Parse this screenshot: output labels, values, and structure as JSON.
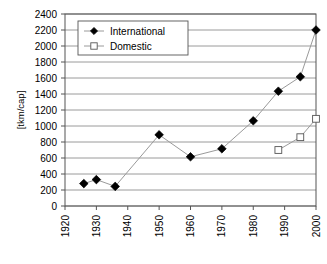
{
  "chart_data": {
    "type": "line",
    "title": "",
    "xlabel": "",
    "ylabel": "[tkm/cap]",
    "xlim": [
      1920,
      2000
    ],
    "ylim": [
      0,
      2400
    ],
    "grid": true,
    "legend_position": "top-left",
    "xticks": [
      "1920",
      "1930",
      "1940",
      "1950",
      "1960",
      "1970",
      "1980",
      "1990",
      "2000"
    ],
    "xtick_values": [
      1920,
      1930,
      1940,
      1950,
      1960,
      1970,
      1980,
      1990,
      2000
    ],
    "yticks": [
      "0",
      "200",
      "400",
      "600",
      "800",
      "1000",
      "1200",
      "1400",
      "1600",
      "1800",
      "2000",
      "2200",
      "2400"
    ],
    "ytick_values": [
      0,
      200,
      400,
      600,
      800,
      1000,
      1200,
      1400,
      1600,
      1800,
      2000,
      2200,
      2400
    ],
    "series": [
      {
        "name": "International",
        "marker": "filled-diamond",
        "x": [
          1926,
          1930,
          1936,
          1950,
          1960,
          1970,
          1980,
          1988,
          1995,
          2000
        ],
        "values": [
          280,
          330,
          245,
          890,
          615,
          715,
          1065,
          1435,
          1615,
          2200
        ]
      },
      {
        "name": "Domestic",
        "marker": "open-square",
        "x": [
          1988,
          1995,
          2000
        ],
        "values": [
          700,
          860,
          1090
        ]
      }
    ]
  },
  "legend": {
    "entries": [
      {
        "label": "International"
      },
      {
        "label": "Domestic"
      }
    ]
  },
  "colors": {
    "line": "#9a9a9a",
    "grid": "#808080",
    "axis": "#555555",
    "marker_filled": "#000000",
    "marker_open_fill": "#ffffff",
    "background": "#ffffff"
  }
}
